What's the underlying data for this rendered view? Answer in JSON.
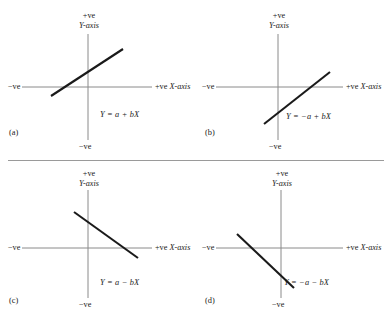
{
  "figure": {
    "axis_labels": {
      "y_positive": "+ve",
      "y_axis_name": "Y-axis",
      "x_negative": "−ve",
      "x_positive": "+ve",
      "x_axis_name": "X-axis",
      "y_negative": "−ve"
    },
    "colors": {
      "axis": "#8a8a8a",
      "line": "#1a1a1a",
      "text": "#1a1a1a",
      "rule": "#9a9a9a",
      "background": "#ffffff"
    },
    "panels": [
      {
        "id": "a",
        "caption": "(a)",
        "equation": "Y = a + bX",
        "intercept_sign": "positive",
        "slope_sign": "positive",
        "description": "upward sloping line crossing X-axis left of origin"
      },
      {
        "id": "b",
        "caption": "(b)",
        "equation": "Y = −a + bX",
        "intercept_sign": "negative",
        "slope_sign": "positive",
        "description": "upward sloping line crossing X-axis right of origin"
      },
      {
        "id": "c",
        "caption": "(c)",
        "equation": "Y = a − bX",
        "intercept_sign": "positive",
        "slope_sign": "negative",
        "description": "downward sloping line from upper-left quadrant"
      },
      {
        "id": "d",
        "caption": "(d)",
        "equation": "Y = −a − bX",
        "intercept_sign": "negative",
        "slope_sign": "negative",
        "description": "downward sloping line through lower-left region"
      }
    ]
  }
}
